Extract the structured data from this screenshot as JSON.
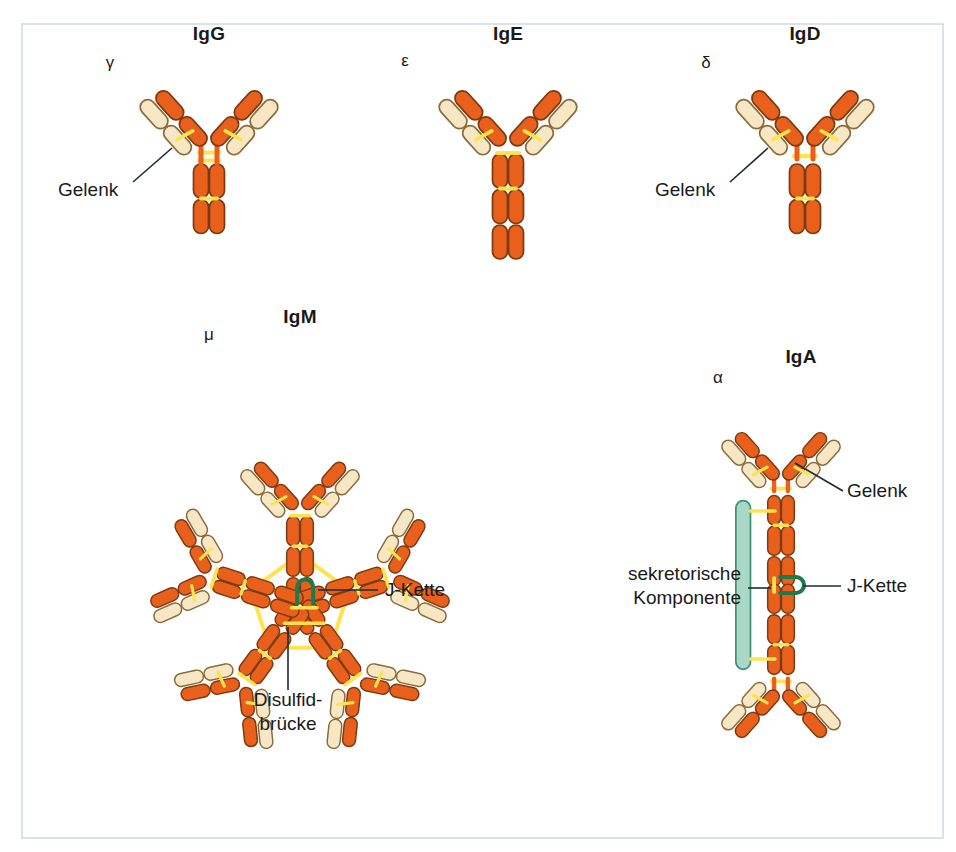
{
  "figure": {
    "caption_title": "Immunglobulin-Klassen",
    "background_color": "#ffffff",
    "border_color": "#c8d8e4",
    "border": {
      "x": 22,
      "y": 24,
      "width": 921,
      "height": 814
    }
  },
  "palette": {
    "heavy_chain_fill": "#E8601C",
    "heavy_chain_stroke": "#7B3A10",
    "light_chain_fill": "#F7E7C4",
    "light_chain_stroke": "#8A6A3A",
    "disulfide_yellow": "#FFE34D",
    "disulfide_yellow_stroke": "#F2C200",
    "j_chain_green": "#1E7A4C",
    "secretory_fill": "#A9D8C6",
    "secretory_stroke": "#3E8F73",
    "label_text": "#1a1a1a",
    "leader_line": "#1c2b3a"
  },
  "panels": [
    {
      "id": "igg",
      "title": "IgG",
      "title_x": 209,
      "title_y": 40,
      "heavy_chain_symbol": "γ",
      "heavy_chain_symbol_x": 110,
      "heavy_chain_symbol_y": 68,
      "center_x": 209,
      "center_y": 150,
      "scale": 1.0,
      "rotation": 0,
      "tail_domains": 2,
      "hinge_style": "double-bar",
      "structure": "monomer",
      "callouts": [
        {
          "name": "hinge",
          "text": "Gelenk",
          "text_x": 58,
          "text_y": 196,
          "anchor": "start",
          "leader": [
            [
              133,
              182
            ],
            [
              172,
              148
            ]
          ]
        }
      ]
    },
    {
      "id": "ige",
      "title": "IgE",
      "title_x": 508,
      "title_y": 40,
      "heavy_chain_symbol": "ε",
      "heavy_chain_symbol_x": 405,
      "heavy_chain_symbol_y": 66,
      "center_x": 508,
      "center_y": 150,
      "scale": 1.0,
      "rotation": 0,
      "tail_domains": 3,
      "hinge_style": "none",
      "structure": "monomer",
      "callouts": []
    },
    {
      "id": "igd",
      "title": "IgD",
      "title_x": 805,
      "title_y": 40,
      "heavy_chain_symbol": "δ",
      "heavy_chain_symbol_x": 706,
      "heavy_chain_symbol_y": 68,
      "center_x": 805,
      "center_y": 150,
      "scale": 1.0,
      "rotation": 0,
      "tail_domains": 2,
      "hinge_style": "single-bar",
      "structure": "monomer",
      "callouts": [
        {
          "name": "hinge",
          "text": "Gelenk",
          "text_x": 655,
          "text_y": 196,
          "anchor": "start",
          "leader": [
            [
              730,
              182
            ],
            [
              768,
              148
            ]
          ]
        }
      ]
    },
    {
      "id": "igm",
      "title": "IgM",
      "title_x": 300,
      "title_y": 323,
      "heavy_chain_symbol": "μ",
      "heavy_chain_symbol_x": 209,
      "heavy_chain_symbol_y": 340,
      "center_x": 300,
      "center_y": 606,
      "scale": 0.86,
      "rotation": 0,
      "tail_domains": 3,
      "hinge_style": "none",
      "structure": "pentamer",
      "subunit_count": 5,
      "callouts": [
        {
          "name": "j-chain",
          "text": "J-Kette",
          "text_x": 385,
          "text_y": 596,
          "anchor": "start",
          "leader": [
            [
              378,
              590
            ],
            [
              318,
              590
            ]
          ]
        },
        {
          "name": "disulfide-bridge",
          "text": "Disulfid-",
          "text2": "brücke",
          "text_x": 288,
          "text_y": 706,
          "text2_x": 288,
          "text2_y": 730,
          "anchor": "middle",
          "leader": [
            [
              288,
              690
            ],
            [
              288,
              627
            ]
          ]
        }
      ]
    },
    {
      "id": "iga",
      "title": "IgA",
      "title_x": 801,
      "title_y": 363,
      "heavy_chain_symbol": "α",
      "heavy_chain_symbol_x": 718,
      "heavy_chain_symbol_y": 383,
      "center_x": 781,
      "center_y": 585,
      "scale": 0.86,
      "rotation": 0,
      "tail_domains": 3,
      "hinge_style": "single-bar",
      "structure": "dimer",
      "subunit_count": 2,
      "has_secretory_component": true,
      "callouts": [
        {
          "name": "hinge",
          "text": "Gelenk",
          "text_x": 847,
          "text_y": 497,
          "anchor": "start",
          "leader": [
            [
              843,
              491
            ],
            [
              795,
              463
            ]
          ]
        },
        {
          "name": "j-chain",
          "text": "J-Kette",
          "text_x": 847,
          "text_y": 592,
          "anchor": "start",
          "leader": [
            [
              841,
              586
            ],
            [
              803,
              586
            ]
          ]
        },
        {
          "name": "secretory-component",
          "text": "sekretorische",
          "text2": "Komponente",
          "text_x": 741,
          "text_y": 580,
          "text2_x": 741,
          "text2_y": 604,
          "anchor": "end",
          "leader": [
            [
              748,
              588
            ],
            [
              771,
              588
            ]
          ]
        }
      ]
    }
  ],
  "legend_terms": {
    "hinge": "Gelenk",
    "j_chain": "J-Kette",
    "disulfide_bridge_line1": "Disulfid-",
    "disulfide_bridge_line2": "brücke",
    "secretory_component_line1": "sekretorische",
    "secretory_component_line2": "Komponente"
  },
  "geometry": {
    "domain_length": 34,
    "domain_width": 15,
    "arm_angle_deg": 42,
    "pentamer_step_deg": 72
  }
}
